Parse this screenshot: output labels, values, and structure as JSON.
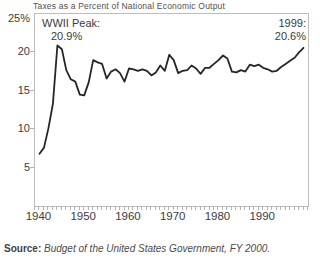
{
  "window": {
    "width": 320,
    "height": 262
  },
  "chart": {
    "title": "Taxes as a Percent of National Economic Output",
    "annotations": {
      "wwii_peak": {
        "line1": "WWII Peak:",
        "line2": "20.9%"
      },
      "end": {
        "line1": "1999:",
        "line2": "20.6%"
      }
    }
  },
  "source": {
    "label": "Source:",
    "text": "Budget of the United States Government, FY 2000."
  },
  "colors": {
    "line": "#262626",
    "axis": "#b4b4b4",
    "text": "#3c3c3c",
    "title": "#4f4f4f"
  },
  "chart_data": {
    "type": "line",
    "title": "Taxes as a Percent of National Economic Output",
    "xlabel": "",
    "ylabel": "",
    "xlim": [
      1939,
      2000
    ],
    "ylim": [
      0,
      25
    ],
    "grid": false,
    "legend": "none",
    "x": [
      1940,
      1941,
      1942,
      1943,
      1944,
      1945,
      1946,
      1947,
      1948,
      1949,
      1950,
      1951,
      1952,
      1953,
      1954,
      1955,
      1956,
      1957,
      1958,
      1959,
      1960,
      1961,
      1962,
      1963,
      1964,
      1965,
      1966,
      1967,
      1968,
      1969,
      1970,
      1971,
      1972,
      1973,
      1974,
      1975,
      1976,
      1977,
      1978,
      1979,
      1980,
      1981,
      1982,
      1983,
      1984,
      1985,
      1986,
      1987,
      1988,
      1989,
      1990,
      1991,
      1992,
      1993,
      1994,
      1995,
      1996,
      1997,
      1998,
      1999
    ],
    "values": [
      6.8,
      7.6,
      10.1,
      13.3,
      20.9,
      20.4,
      17.7,
      16.5,
      16.2,
      14.5,
      14.4,
      16.1,
      19.0,
      18.7,
      18.5,
      16.6,
      17.5,
      17.8,
      17.3,
      16.2,
      17.9,
      17.8,
      17.6,
      17.8,
      17.6,
      17.0,
      17.4,
      18.3,
      17.6,
      19.7,
      19.0,
      17.3,
      17.6,
      17.7,
      18.3,
      17.9,
      17.2,
      18.0,
      18.0,
      18.5,
      19.0,
      19.6,
      19.2,
      17.5,
      17.4,
      17.7,
      17.5,
      18.4,
      18.2,
      18.4,
      18.0,
      17.8,
      17.5,
      17.6,
      18.1,
      18.5,
      18.9,
      19.3,
      20.0,
      20.6
    ],
    "xticks": [
      1940,
      1950,
      1960,
      1970,
      1980,
      1990
    ],
    "minor_xtick_step_years": 1,
    "yticks": [
      {
        "value": 25,
        "label": "25%"
      },
      {
        "value": 20,
        "label": "20"
      },
      {
        "value": 15,
        "label": "15"
      },
      {
        "value": 10,
        "label": "10"
      },
      {
        "value": 5,
        "label": "5"
      }
    ]
  }
}
